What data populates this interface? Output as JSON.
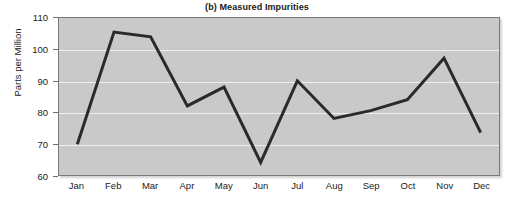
{
  "chart_data": {
    "type": "line",
    "title": "(b) Measured Impurities",
    "xlabel": "",
    "ylabel": "Parts per Million",
    "categories": [
      "Jan",
      "Feb",
      "Mar",
      "Apr",
      "May",
      "Jun",
      "Jul",
      "Aug",
      "Sep",
      "Oct",
      "Nov",
      "Dec"
    ],
    "values": [
      69.8,
      105.5,
      104,
      82,
      88,
      64,
      90,
      78,
      80.5,
      84,
      97.2,
      73.5
    ],
    "ylim": [
      60,
      110
    ],
    "yticks": [
      60,
      70,
      80,
      90,
      100,
      110
    ],
    "ytick_labels": [
      "60",
      "70",
      "80",
      "90",
      "100",
      "110"
    ],
    "grid": true,
    "legend": false,
    "series_name": "Measured Impurities",
    "colors": {
      "line": "#2a2a2a",
      "plot_background": "#c9c9c9",
      "gridline": "#efefef",
      "axis": "#7a7a7a",
      "text": "#1a1a1a",
      "figure_background": "#ffffff"
    },
    "line_width": 3
  }
}
